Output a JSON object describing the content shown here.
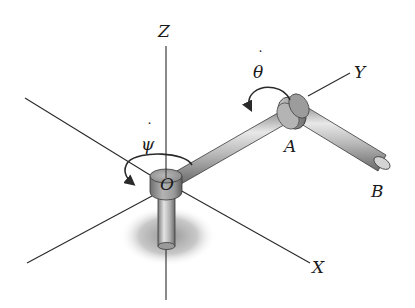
{
  "figure": {
    "axes": [
      {
        "id": "z",
        "label": "Z"
      },
      {
        "id": "y",
        "label": "Y"
      },
      {
        "id": "x",
        "label": "X"
      }
    ],
    "points": [
      {
        "id": "origin",
        "label": "O"
      },
      {
        "id": "joint",
        "label": "A"
      },
      {
        "id": "end",
        "label": "B"
      }
    ],
    "rates": [
      {
        "id": "psi-dot",
        "symbol": "ψ",
        "dot": "˙",
        "about": "Z axis at O"
      },
      {
        "id": "theta-dot",
        "symbol": "θ",
        "dot": "˙",
        "about": "rod axis at A"
      }
    ],
    "colors": {
      "axis": "#2a2a2a",
      "metal_light": "#e6e6e6",
      "metal_mid": "#a8a8a8",
      "metal_dark": "#5a5a5a",
      "shadow": "#9a9a9a"
    }
  }
}
